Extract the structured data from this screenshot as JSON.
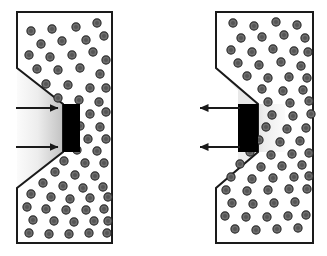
{
  "figure": {
    "width": 327,
    "height": 256,
    "background_color": "#ffffff"
  },
  "colors": {
    "outline": "#1a1a1a",
    "matrix_fill": "#ffffff",
    "particle_fill": "#6e6e6e",
    "particle_stroke": "#2b2b2b",
    "wedge_black": "#000000",
    "zone_light": "#f2f2f2",
    "zone_dark": "#bdbdbd",
    "arrow_color": "#1a1a1a"
  },
  "panels": [
    {
      "id": "left-panel",
      "name": "left-specimen",
      "notch_side": "left",
      "wedge_label": "",
      "arrows": {
        "direction": "right",
        "meaning": "inward load",
        "count": 2,
        "items": [
          {
            "name": "arrow-upper-left-panel",
            "y": 108,
            "from_x": 16,
            "to_x": 62
          },
          {
            "name": "arrow-lower-left-panel",
            "y": 147,
            "from_x": 16,
            "to_x": 62
          }
        ]
      },
      "geometry": {
        "top_y": 12,
        "bottom_y": 243,
        "outer_x": 112,
        "notch_x": 17,
        "notch_upper_y": 68,
        "notch_root_top_y": 104,
        "notch_root_bottom_y": 152,
        "notch_lower_y": 188,
        "wedge_x": 63,
        "wedge_w": 17
      },
      "particle_count": 62
    },
    {
      "id": "right-panel",
      "name": "right-specimen",
      "notch_side": "left",
      "wedge_label": "",
      "arrows": {
        "direction": "left",
        "meaning": "outward load",
        "count": 2,
        "items": [
          {
            "name": "arrow-upper-right-panel",
            "y": 108,
            "from_x": 240,
            "to_x": 196
          },
          {
            "name": "arrow-lower-right-panel",
            "y": 147,
            "from_x": 240,
            "to_x": 196
          }
        ]
      },
      "geometry": {
        "top_y": 12,
        "bottom_y": 243,
        "outer_x": 313,
        "notch_x": 216,
        "notch_upper_y": 68,
        "notch_root_top_y": 104,
        "notch_root_bottom_y": 152,
        "notch_lower_y": 188,
        "wedge_x": 238,
        "wedge_w": 20
      },
      "particle_count": 62
    }
  ],
  "particles": {
    "radius": 4.1,
    "inner_radius": 2.0,
    "left": [
      [
        31,
        31
      ],
      [
        52,
        29
      ],
      [
        76,
        27
      ],
      [
        97,
        23
      ],
      [
        41,
        44
      ],
      [
        62,
        41
      ],
      [
        86,
        40
      ],
      [
        104,
        36
      ],
      [
        29,
        55
      ],
      [
        50,
        57
      ],
      [
        72,
        55
      ],
      [
        93,
        52
      ],
      [
        106,
        60
      ],
      [
        37,
        69
      ],
      [
        58,
        70
      ],
      [
        80,
        68
      ],
      [
        100,
        74
      ],
      [
        46,
        84
      ],
      [
        68,
        85
      ],
      [
        90,
        88
      ],
      [
        106,
        88
      ],
      [
        58,
        98
      ],
      [
        79,
        100
      ],
      [
        99,
        102
      ],
      [
        90,
        114
      ],
      [
        106,
        112
      ],
      [
        80,
        126
      ],
      [
        100,
        127
      ],
      [
        88,
        139
      ],
      [
        106,
        139
      ],
      [
        77,
        150
      ],
      [
        97,
        151
      ],
      [
        64,
        161
      ],
      [
        85,
        163
      ],
      [
        104,
        163
      ],
      [
        55,
        172
      ],
      [
        75,
        175
      ],
      [
        95,
        176
      ],
      [
        43,
        183
      ],
      [
        63,
        186
      ],
      [
        83,
        188
      ],
      [
        103,
        187
      ],
      [
        31,
        194
      ],
      [
        51,
        197
      ],
      [
        70,
        199
      ],
      [
        90,
        198
      ],
      [
        108,
        197
      ],
      [
        27,
        207
      ],
      [
        46,
        209
      ],
      [
        66,
        210
      ],
      [
        86,
        210
      ],
      [
        104,
        209
      ],
      [
        33,
        220
      ],
      [
        54,
        221
      ],
      [
        74,
        222
      ],
      [
        94,
        221
      ],
      [
        108,
        221
      ],
      [
        29,
        233
      ],
      [
        49,
        234
      ],
      [
        69,
        234
      ],
      [
        89,
        233
      ],
      [
        107,
        233
      ]
    ],
    "right": [
      [
        233,
        23
      ],
      [
        254,
        26
      ],
      [
        276,
        22
      ],
      [
        297,
        25
      ],
      [
        241,
        38
      ],
      [
        262,
        37
      ],
      [
        284,
        35
      ],
      [
        305,
        38
      ],
      [
        231,
        50
      ],
      [
        252,
        52
      ],
      [
        273,
        49
      ],
      [
        294,
        51
      ],
      [
        308,
        52
      ],
      [
        238,
        63
      ],
      [
        259,
        65
      ],
      [
        281,
        62
      ],
      [
        301,
        66
      ],
      [
        247,
        76
      ],
      [
        268,
        78
      ],
      [
        289,
        77
      ],
      [
        307,
        78
      ],
      [
        262,
        89
      ],
      [
        283,
        91
      ],
      [
        303,
        90
      ],
      [
        268,
        102
      ],
      [
        290,
        103
      ],
      [
        309,
        101
      ],
      [
        272,
        115
      ],
      [
        293,
        116
      ],
      [
        311,
        114
      ],
      [
        266,
        127
      ],
      [
        287,
        129
      ],
      [
        306,
        128
      ],
      [
        259,
        140
      ],
      [
        280,
        142
      ],
      [
        300,
        141
      ],
      [
        250,
        152
      ],
      [
        271,
        155
      ],
      [
        292,
        154
      ],
      [
        309,
        153
      ],
      [
        240,
        164
      ],
      [
        261,
        167
      ],
      [
        282,
        166
      ],
      [
        302,
        165
      ],
      [
        231,
        177
      ],
      [
        252,
        179
      ],
      [
        273,
        178
      ],
      [
        294,
        177
      ],
      [
        309,
        176
      ],
      [
        226,
        190
      ],
      [
        247,
        191
      ],
      [
        268,
        190
      ],
      [
        289,
        189
      ],
      [
        307,
        189
      ],
      [
        232,
        203
      ],
      [
        253,
        204
      ],
      [
        274,
        203
      ],
      [
        295,
        202
      ],
      [
        225,
        216
      ],
      [
        246,
        217
      ],
      [
        267,
        217
      ],
      [
        288,
        216
      ],
      [
        306,
        215
      ],
      [
        235,
        229
      ],
      [
        256,
        230
      ],
      [
        277,
        229
      ],
      [
        298,
        228
      ]
    ]
  }
}
